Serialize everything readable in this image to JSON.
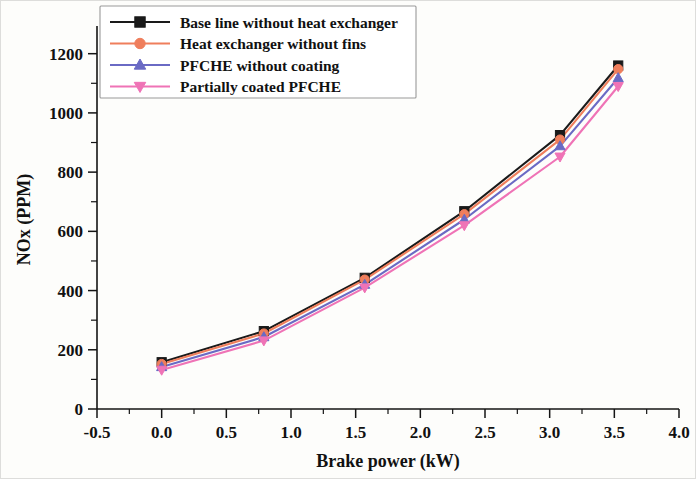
{
  "chart_data": {
    "type": "line",
    "title": "",
    "xlabel": "Brake power (kW)",
    "ylabel": "NOx (PPM)",
    "xlim": [
      -0.5,
      4.0
    ],
    "ylim": [
      0,
      1280
    ],
    "grid": false,
    "legend_position": "top-left",
    "x_ticks": [
      "-0.5",
      "0.0",
      "0.5",
      "1.0",
      "1.5",
      "2.0",
      "2.5",
      "3.0",
      "3.5",
      "4.0"
    ],
    "x_tick_values": [
      -0.5,
      0.0,
      0.5,
      1.0,
      1.5,
      2.0,
      2.5,
      3.0,
      3.5,
      4.0
    ],
    "y_ticks": [
      "0",
      "200",
      "400",
      "600",
      "800",
      "1000",
      "1200"
    ],
    "y_tick_values": [
      0,
      200,
      400,
      600,
      800,
      1000,
      1200
    ],
    "x": [
      0.0,
      0.79,
      1.57,
      2.34,
      3.08,
      3.53
    ],
    "series": [
      {
        "name": "Base line without heat exchanger",
        "color": "#1a1a1a",
        "marker": "square",
        "values": [
          158,
          263,
          443,
          668,
          925,
          1160
        ]
      },
      {
        "name": "Heat exchanger without fins",
        "color": "#ef7e5c",
        "marker": "circle",
        "values": [
          152,
          255,
          437,
          658,
          910,
          1148
        ]
      },
      {
        "name": "PFCHE without coating",
        "color": "#6a6ac4",
        "marker": "triangle-up",
        "values": [
          142,
          243,
          420,
          640,
          888,
          1118
        ]
      },
      {
        "name": "Partially coated PFCHE",
        "color": "#ef73b6",
        "marker": "triangle-down",
        "values": [
          132,
          231,
          410,
          620,
          852,
          1090
        ]
      }
    ]
  }
}
